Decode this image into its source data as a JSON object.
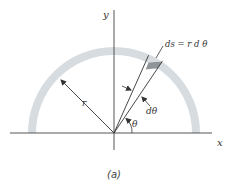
{
  "diagram": {
    "axes": {
      "x_label": "x",
      "y_label": "y"
    },
    "radius_label": "r",
    "angle_label": "θ",
    "dtheta_label": "dθ",
    "ds_label": "ds = r d θ",
    "caption": "(a)",
    "colors": {
      "ring": "#d6dcdf",
      "segment": "#8f9498",
      "line": "#333333",
      "background": "#ffffff"
    }
  }
}
